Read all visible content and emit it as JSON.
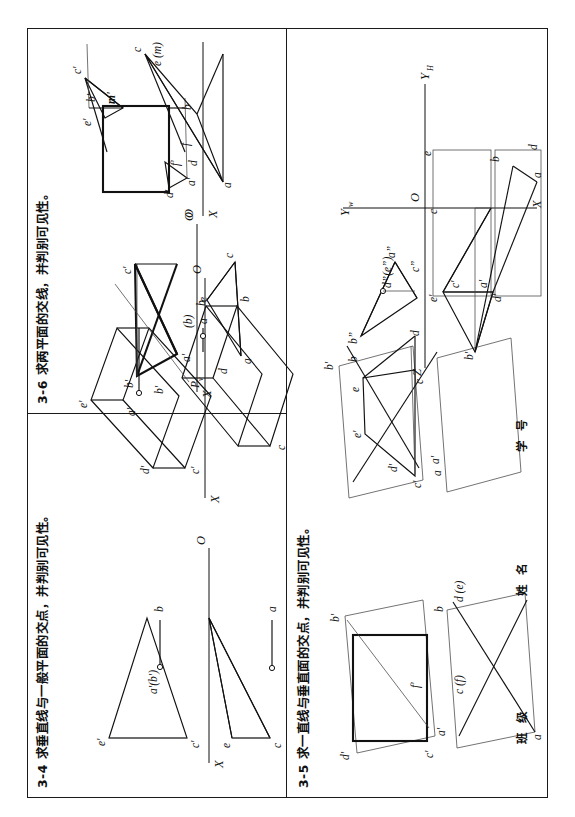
{
  "sheet": {
    "orientation": "landscape-rotated",
    "background": "#ffffff",
    "ink": "#111111"
  },
  "panels": [
    {
      "id": "3-4",
      "number": "3-4",
      "title": "3-4  求垂直线与一般平面的交点，并判别可见性。",
      "figures": [
        {
          "name": "figure-3-4-left",
          "description": "triangle c'-e'-c with axis X-O, point a'(b') on horizontal projector",
          "labels": [
            "e'",
            "a'(b')",
            "c'",
            "b",
            "a",
            "e",
            "c",
            "X",
            "O"
          ]
        },
        {
          "name": "figure-3-4-right",
          "description": "oblique prism projection with axis X-O, point a' and a(b)",
          "labels": [
            "a'",
            "e'",
            "b'",
            "d'",
            "c'",
            "(b)",
            "a",
            "e",
            "d",
            "c",
            "b",
            "X",
            "O"
          ]
        }
      ]
    },
    {
      "id": "3-5",
      "number": "3-5",
      "title": "3-5  求一直线与垂直面的交点，并判别可见性。",
      "figures": [
        {
          "name": "figure-3-5-left",
          "description": "rectangle front view with line a'-b' and f', bottom view parallelogram with c(f) and d(e)",
          "labels": [
            "d'",
            "b'",
            "c'",
            "a'",
            "f'",
            "b",
            "d (e)",
            "c (f)",
            "a"
          ]
        },
        {
          "name": "figure-3-5-right",
          "description": "two parallelograms crossing, trapezoid in middle",
          "labels": [
            "b'",
            "e'",
            "d'",
            "c'",
            "a'",
            "b",
            "e",
            "d",
            "c",
            "a"
          ]
        }
      ]
    },
    {
      "id": "3-6",
      "number": "3-6",
      "title": "3-6  求两平面的交线，并判别可见性。",
      "figures": [
        {
          "name": "figure-3-6-left",
          "description": "two triangles with trace line Pv, axis X-O",
          "labels": [
            "c'",
            "b'",
            "a'",
            "Pv",
            "X",
            "O",
            "b",
            "c",
            "a"
          ]
        },
        {
          "name": "figure-3-6-middle",
          "description": "front view rectangle with m' and triangle, bottom view with e (m) and f",
          "labels": [
            "c'",
            "e'",
            "b'",
            "m'",
            "d'",
            "a'",
            "f'",
            "f",
            "d",
            "a",
            "b",
            "c",
            "e (m)",
            "X",
            "O"
          ]
        },
        {
          "name": "figure-3-6-right",
          "description": "three-view projection: frontal triangle b'-c'-a', horizontal a-b-c, profile b\"-a\"-c\" with d\"(e\")",
          "labels": [
            "Z",
            "b\"",
            "a\"",
            "d\"(e\")",
            "c\"",
            "O",
            "Yw",
            "YH",
            "e'",
            "c'",
            "b'",
            "d'",
            "a'",
            "X",
            "d",
            "a",
            "c",
            "e",
            "b"
          ]
        }
      ]
    }
  ],
  "form_fields": [
    {
      "name": "class-field",
      "label": "班 级"
    },
    {
      "name": "name-field",
      "label": "姓 名"
    },
    {
      "name": "student-id-field",
      "label": "学 号"
    }
  ]
}
